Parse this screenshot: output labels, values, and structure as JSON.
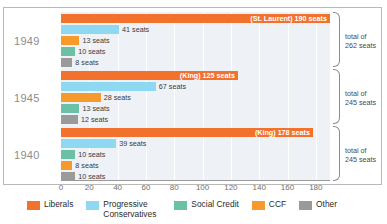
{
  "chart_data": {
    "type": "bar",
    "title": "",
    "xlabel": "",
    "ylabel": "",
    "xlim": [
      0,
      190
    ],
    "axis_ticks": [
      "0",
      "20",
      "40",
      "60",
      "80",
      "100",
      "120",
      "140",
      "160",
      "180"
    ],
    "grid": true,
    "legend_position": "bottom",
    "orientation": "horizontal",
    "legend": [
      {
        "name": "Liberals",
        "color": "#f2712c"
      },
      {
        "name": "Progressive Conservatives",
        "color": "#8ed8f2"
      },
      {
        "name": "Social Credit",
        "color": "#6cc0a5"
      },
      {
        "name": "CCF",
        "color": "#f79a2e"
      },
      {
        "name": "Other",
        "color": "#9a9a9a"
      }
    ],
    "groups": [
      {
        "year": "1949",
        "total_label_line1": "total of",
        "total_label_line2": "262 seats",
        "total": 262,
        "bars": [
          {
            "party": "Liberals",
            "value": 190,
            "label": "(St. Laurent) 190 seats",
            "color": "#f2712c",
            "label_inside": true
          },
          {
            "party": "Progressive Conservatives",
            "value": 41,
            "label": "41 seats",
            "color": "#8ed8f2",
            "label_inside": false
          },
          {
            "party": "CCF",
            "value": 13,
            "label": "13 seats",
            "color": "#f79a2e",
            "label_inside": false
          },
          {
            "party": "Social Credit",
            "value": 10,
            "label": "10 seats",
            "color": "#6cc0a5",
            "label_inside": false
          },
          {
            "party": "Other",
            "value": 8,
            "label": "8 seats",
            "color": "#9a9a9a",
            "label_inside": false
          }
        ]
      },
      {
        "year": "1945",
        "total_label_line1": "total of",
        "total_label_line2": "245 seats",
        "total": 245,
        "bars": [
          {
            "party": "Liberals",
            "value": 125,
            "label": "(King) 125 seats",
            "color": "#f2712c",
            "label_inside": true
          },
          {
            "party": "Progressive Conservatives",
            "value": 67,
            "label": "67 seats",
            "color": "#8ed8f2",
            "label_inside": false
          },
          {
            "party": "CCF",
            "value": 28,
            "label": "28 seats",
            "color": "#f79a2e",
            "label_inside": false
          },
          {
            "party": "Social Credit",
            "value": 13,
            "label": "13 seats",
            "color": "#6cc0a5",
            "label_inside": false
          },
          {
            "party": "Other",
            "value": 12,
            "label": "12 seats",
            "color": "#9a9a9a",
            "label_inside": false
          }
        ]
      },
      {
        "year": "1940",
        "total_label_line1": "total of",
        "total_label_line2": "245 seats",
        "total": 245,
        "bars": [
          {
            "party": "Liberals",
            "value": 178,
            "label": "(King) 178 seats",
            "color": "#f2712c",
            "label_inside": true
          },
          {
            "party": "Progressive Conservatives",
            "value": 39,
            "label": "39 seats",
            "color": "#8ed8f2",
            "label_inside": false
          },
          {
            "party": "Social Credit",
            "value": 10,
            "label": "10 seats",
            "color": "#6cc0a5",
            "label_inside": false
          },
          {
            "party": "CCF",
            "value": 8,
            "label": "8 seats",
            "color": "#f79a2e",
            "label_inside": false
          },
          {
            "party": "Other",
            "value": 10,
            "label": "10 seats",
            "color": "#9a9a9a",
            "label_inside": false
          }
        ]
      }
    ]
  }
}
